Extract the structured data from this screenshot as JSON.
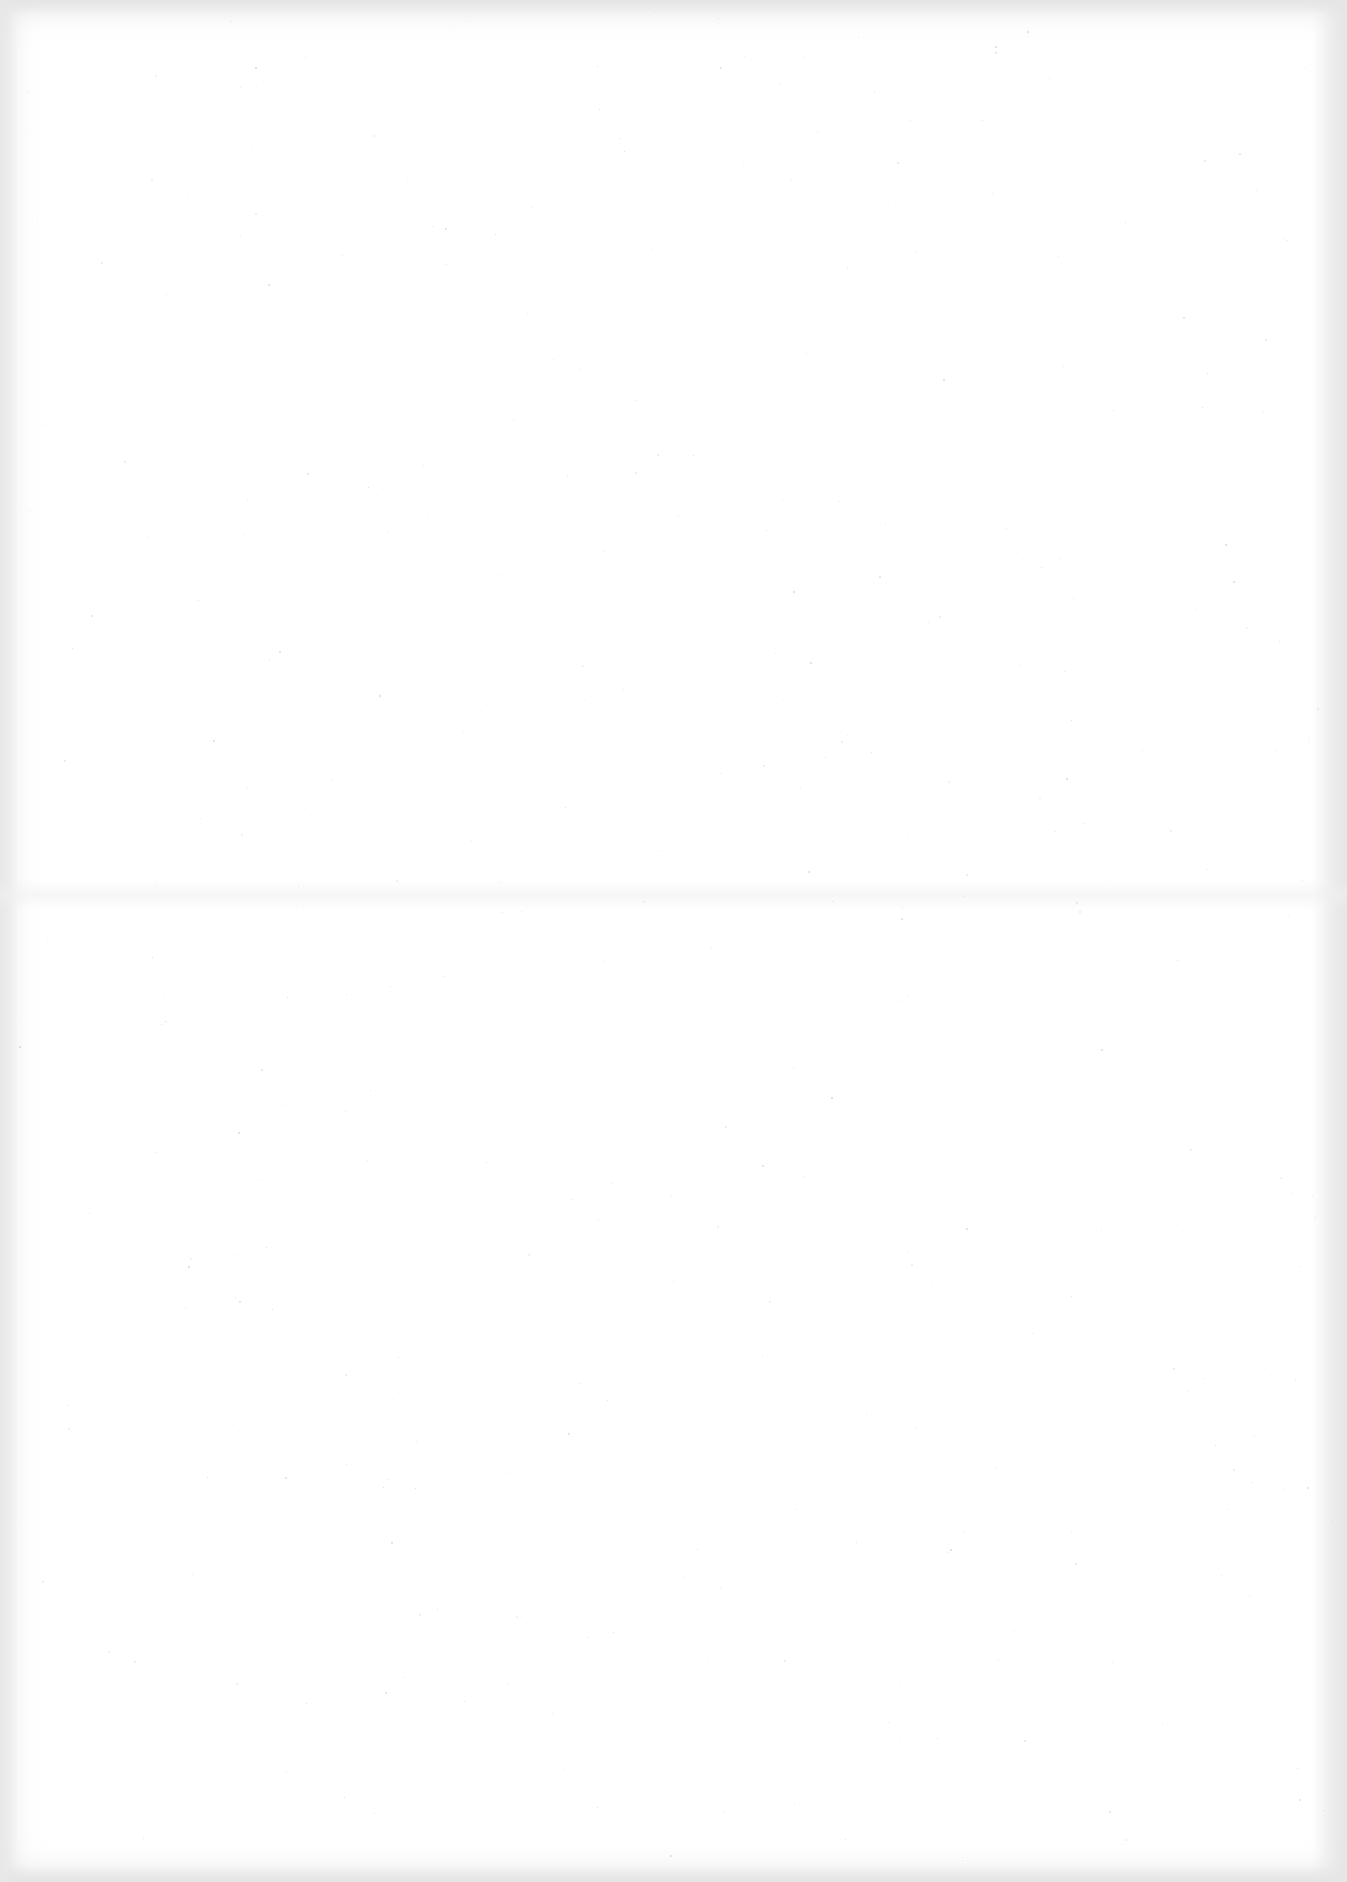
{
  "page": {
    "type": "blank-scanned-sheet",
    "text_content": [],
    "colors": {
      "paper": "#ffffff",
      "edge_shadow": "#e4e4e4",
      "speck": "#c9c9c9"
    }
  }
}
